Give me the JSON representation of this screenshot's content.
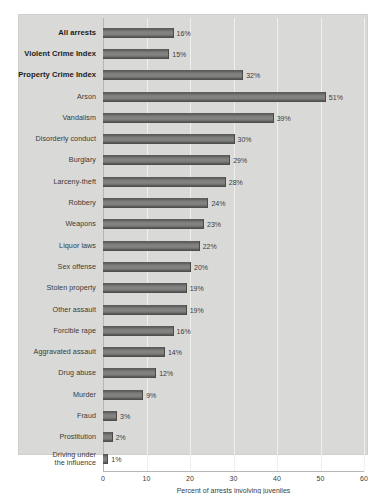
{
  "chart_data": {
    "type": "bar",
    "orientation": "horizontal",
    "title": "",
    "xlabel": "Percent of arrests involving juveniles",
    "ylabel": "",
    "xlim": [
      0,
      60
    ],
    "xticks": [
      0,
      10,
      20,
      30,
      40,
      50,
      60
    ],
    "xtick_labels": [
      "0",
      "10",
      "20",
      "30",
      "40",
      "50",
      "60"
    ],
    "grid": true,
    "legend": null,
    "value_suffix": "%",
    "categories": [
      "All arrests",
      "Violent Crime Index",
      "Property Crime Index",
      "Arson",
      "Vandalism",
      "Disorderly conduct",
      "Burglary",
      "Larceny-theft",
      "Robbery",
      "Weapons",
      "Liquor laws",
      "Sex offense",
      "Stolen property",
      "Other assault",
      "Forcible rape",
      "Aggravated assault",
      "Drug abuse",
      "Murder",
      "Fraud",
      "Prostitution",
      "Driving under the influence"
    ],
    "values": [
      16,
      15,
      32,
      51,
      39,
      30,
      29,
      28,
      24,
      23,
      22,
      20,
      19,
      19,
      16,
      14,
      12,
      9,
      3,
      2,
      1
    ],
    "value_labels": [
      "16%",
      "15%",
      "32%",
      "51%",
      "39%",
      "30%",
      "29%",
      "28%",
      "24%",
      "23%",
      "22%",
      "20%",
      "19%",
      "19%",
      "16%",
      "14%",
      "12%",
      "9%",
      "3%",
      "2%",
      "1%"
    ],
    "emphasized_categories": [
      "All arrests",
      "Violent Crime Index",
      "Property Crime Index"
    ],
    "multiline_categories": {
      "Driving under the influence": [
        "Driving under",
        "the influence"
      ]
    },
    "colors": {
      "panel_background": "#d9d9d7",
      "figure_background": "#ffffff",
      "bar_fill": "#7b7b79",
      "bar_edge": "#4a4a48",
      "gridline": "#efefec",
      "axis_line": "#b6b6b2",
      "text": "#3c3c3a",
      "emphasized_text": "#1b1b1a"
    }
  }
}
